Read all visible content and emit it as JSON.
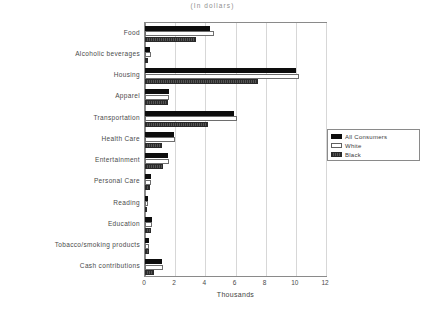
{
  "chart_title_clipped": "CONSUMER  EXPENDITURES",
  "subtitle": "(In dollars)",
  "legend": {
    "items": [
      {
        "label": "All  Consumers",
        "swatch": "solid-black"
      },
      {
        "label": "White",
        "swatch": "white-outline"
      },
      {
        "label": "Black",
        "swatch": "dark-gray-hatched"
      }
    ]
  },
  "xaxis": {
    "label": "Thousands",
    "ticks": [
      "0",
      "2",
      "4",
      "6",
      "8",
      "10",
      "12"
    ]
  },
  "chart_data": {
    "type": "bar",
    "orientation": "horizontal",
    "title": "CONSUMER  EXPENDITURES",
    "subtitle": "(In dollars)",
    "xlabel": "Thousands",
    "ylabel": "",
    "xlim": [
      0,
      12
    ],
    "xticks": [
      0,
      2,
      4,
      6,
      8,
      10,
      12
    ],
    "grid": true,
    "legend_position": "right-middle",
    "categories": [
      "Food",
      "Alcoholic  beverages",
      "Housing",
      "Apparel",
      "Transportation",
      "Health  Care",
      "Entertainment",
      "Personal  Care",
      "Reading",
      "Education",
      "Tobacco/smoking products",
      "Cash  contributions"
    ],
    "series": [
      {
        "name": "All  Consumers",
        "values": [
          4.3,
          0.35,
          10.0,
          1.6,
          5.9,
          1.9,
          1.5,
          0.4,
          0.17,
          0.45,
          0.27,
          1.1
        ]
      },
      {
        "name": "White",
        "values": [
          4.6,
          0.4,
          10.2,
          1.6,
          6.1,
          2.0,
          1.6,
          0.4,
          0.18,
          0.45,
          0.28,
          1.2
        ]
      },
      {
        "name": "Black",
        "values": [
          3.4,
          0.2,
          7.5,
          1.5,
          4.2,
          1.1,
          1.2,
          0.35,
          0.1,
          0.4,
          0.25,
          0.6
        ]
      }
    ]
  }
}
